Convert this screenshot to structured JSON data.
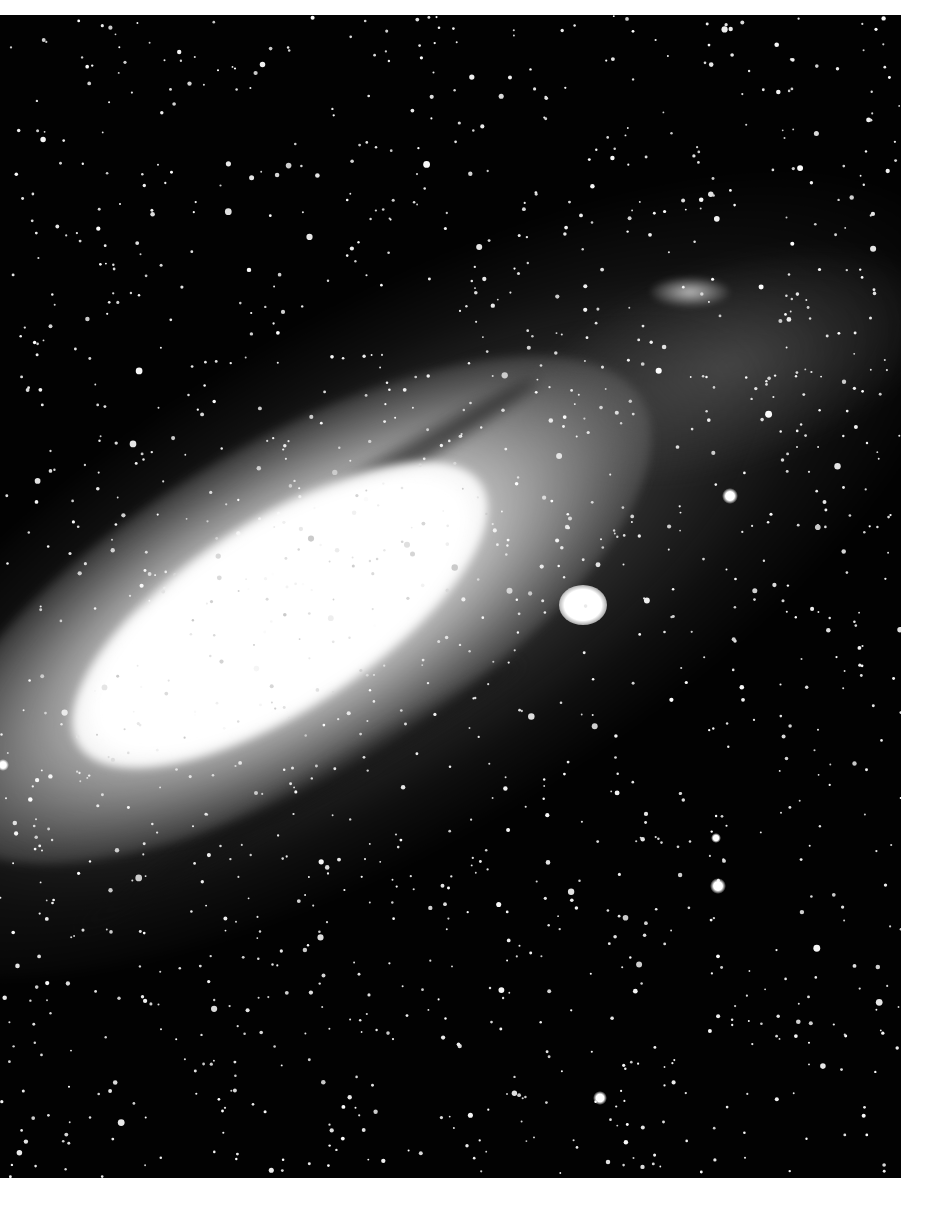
{
  "image": {
    "subject": "Andromeda galaxy, black-and-white astrophotograph",
    "background_color": "#ffffff",
    "photo_color": "#020202",
    "photo_bounds": {
      "x": 0,
      "y": 15,
      "width": 901,
      "height": 1163
    }
  },
  "features": {
    "galaxy_core": {
      "cx": 280,
      "cy": 600,
      "angle_deg": -33
    },
    "satellite": {
      "cx": 583,
      "cy": 605,
      "r": 22
    },
    "bright_stars": [
      {
        "x": 730,
        "y": 496,
        "r": 8
      },
      {
        "x": 718,
        "y": 886,
        "r": 8
      },
      {
        "x": 716,
        "y": 838,
        "r": 5
      },
      {
        "x": 600,
        "y": 1098,
        "r": 7
      },
      {
        "x": 3,
        "y": 765,
        "r": 6
      }
    ]
  },
  "star_field": {
    "seed": 1337,
    "count": 1400
  }
}
